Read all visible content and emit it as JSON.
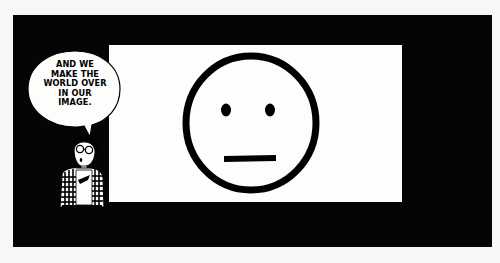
{
  "comic": {
    "speech_bubble": {
      "text": "AND WE\nMAKE THE\nWORLD OVER\nIN OUR\nIMAGE."
    },
    "screen_content": "neutral-face",
    "colors": {
      "panel": "#050505",
      "screen": "#fdfdfc",
      "ink": "#000000",
      "background": "#f7f7f5"
    }
  }
}
